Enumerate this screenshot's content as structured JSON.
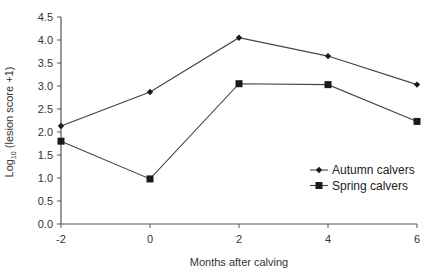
{
  "chart_data": {
    "type": "line",
    "title": "",
    "xlabel": "Months after calving",
    "ylabel": "Log10 (lesion score +1)",
    "ylabel_parts": {
      "main": "Log",
      "sub": "10",
      "rest": " (lesion score +1)"
    },
    "x": [
      -2,
      0,
      2,
      4,
      6
    ],
    "x_ticks": [
      "-2",
      "0",
      "2",
      "4",
      "6"
    ],
    "y_ticks": [
      "0.0",
      "0.5",
      "1.0",
      "1.5",
      "2.0",
      "2.5",
      "3.0",
      "3.5",
      "4.0",
      "4.5"
    ],
    "xlim": [
      -2,
      6
    ],
    "ylim": [
      0,
      4.5
    ],
    "grid": false,
    "legend_position": "right-middle",
    "series": [
      {
        "name": "Autumn calvers",
        "marker": "diamond",
        "color": "#1a1a1a",
        "values": [
          2.13,
          2.87,
          4.05,
          3.65,
          3.03
        ]
      },
      {
        "name": "Spring calvers",
        "marker": "square",
        "color": "#1a1a1a",
        "values": [
          1.8,
          0.98,
          3.05,
          3.03,
          2.23
        ]
      }
    ]
  }
}
